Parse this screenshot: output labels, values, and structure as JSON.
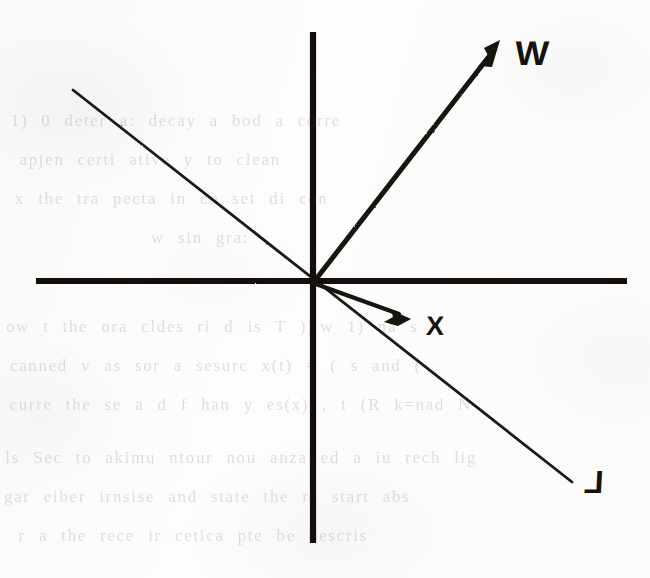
{
  "figure": {
    "kind": "vector-diagram",
    "background_color": "#fdfdfd",
    "ink_color": "#141210",
    "origin": {
      "x": 313,
      "y": 283
    }
  },
  "axes": {
    "horizontal": {
      "name": "horizontal-axis",
      "x1": 36,
      "y1": 281,
      "x2": 627,
      "y2": 281,
      "stroke_width": 6
    },
    "vertical": {
      "name": "vertical-axis",
      "x1": 313,
      "y1": 32,
      "x2": 313,
      "y2": 543,
      "stroke_width": 6
    }
  },
  "vectors": [
    {
      "id": "w",
      "label": "W",
      "from": {
        "x": 313,
        "y": 283
      },
      "to": {
        "x": 500,
        "y": 42
      },
      "stroke_width": 5,
      "arrowhead": true,
      "label_position": {
        "x": 518,
        "y": 40
      },
      "quadrant": "upper-right"
    },
    {
      "id": "x",
      "label": "X",
      "from": {
        "x": 313,
        "y": 283
      },
      "to": {
        "x": 409,
        "y": 318
      },
      "stroke_width": 4,
      "arrowhead": true,
      "label_position": {
        "x": 428,
        "y": 317
      },
      "quadrant": "lower-right"
    }
  ],
  "lines": [
    {
      "id": "l",
      "label": "L",
      "from": {
        "x": 73,
        "y": 90
      },
      "to": {
        "x": 572,
        "y": 482
      },
      "stroke_width": 2.6,
      "arrowhead": false,
      "label_position": {
        "x": 587,
        "y": 471
      },
      "passes_through_origin": true,
      "description": "line through origin from upper-left to lower-right"
    }
  ],
  "ghost_text": {
    "description": "faint show-through text bleeding from the reverse side of the scanned page",
    "lines": [
      {
        "text": "1) 0 deter a: decay  a bod  a  corre",
        "x": 14,
        "y": 119
      },
      {
        "text": "apjen certi  ative  y  to clean",
        "x": 22,
        "y": 158
      },
      {
        "text": "x  the  tra  pecta  in  co  set  di  con",
        "x": 18,
        "y": 197
      },
      {
        "text": "w  sin  gra:",
        "x": 152,
        "y": 236
      },
      {
        "text": "ow  t  the  ora  cldes  ri  d  is   T   )  w   1)  na  s",
        "x": 10,
        "y": 325
      },
      {
        "text": "canned  v  as  sor  a  sesurc  x(t)  =  ( s  and  (",
        "x": 14,
        "y": 364
      },
      {
        "text": "curre  the  se  a  d  f  han  y  es(x)   ,   t  (R   k=nad  N",
        "x": 14,
        "y": 403
      },
      {
        "text": "ls  Sec  to   akimu  ntour  nou  anza  ed  a  iu  rech   lig",
        "x": 10,
        "y": 456
      },
      {
        "text": "gar  eiber  irnsise  and  state  the  re  start  abs",
        "x": 8,
        "y": 495
      },
      {
        "text": "r   a  the  rece  ir  cetica  pte  be  descris",
        "x": 22,
        "y": 534
      }
    ]
  },
  "labels": {
    "w": "W",
    "x": "X",
    "l": "L"
  }
}
